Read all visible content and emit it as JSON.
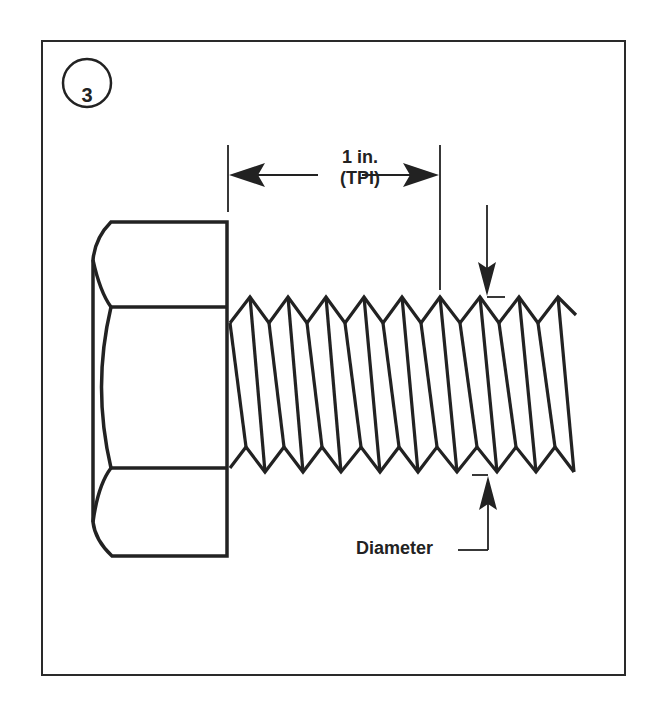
{
  "figure": {
    "step_number": "3",
    "pitch_label_line1": "1 in.",
    "pitch_label_line2": "(TPI)",
    "diameter_label": "Diameter",
    "line_color": "#222222",
    "background": "#ffffff"
  },
  "icons": {
    "bolt": "hex-bolt-illustration",
    "arrow_left": "arrow-left-icon",
    "arrow_right": "arrow-right-icon",
    "arrow_down": "arrow-down-icon",
    "arrow_up": "arrow-up-icon"
  }
}
